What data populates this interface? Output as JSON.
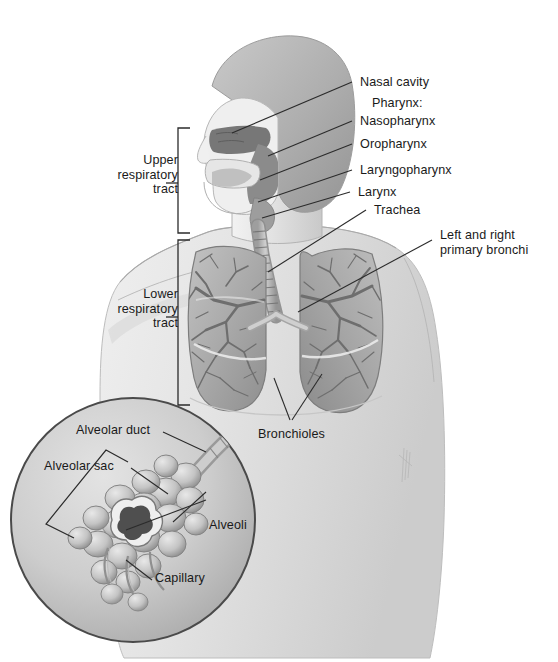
{
  "figure": {
    "background_color": "#ffffff",
    "ink_color": "#1a1a1a",
    "artist_signature": "illegible vertical artist signature"
  },
  "brackets": [
    {
      "name": "upper-respiratory-tract",
      "label": "Upper\nrespiratory\ntract"
    },
    {
      "name": "lower-respiratory-tract",
      "label": "Lower\nrespiratory\ntract"
    }
  ],
  "labels": {
    "nasal_cavity": "Nasal cavity",
    "pharynx": "Pharynx:",
    "nasopharynx": "Nasopharynx",
    "oropharynx": "Oropharynx",
    "laryngopharynx": "Laryngopharynx",
    "larynx": "Larynx",
    "trachea": "Trachea",
    "primary_bronchi": "Left and right\nprimary bronchi",
    "bronchioles": "Bronchioles",
    "alveolar_duct": "Alveolar duct",
    "alveolar_sac": "Alveolar sac",
    "alveoli": "Alveoli",
    "capillary": "Capillary"
  },
  "palette": {
    "skin_light": "#e9e9e9",
    "skin_mid": "#d4d4d4",
    "hair": "#b9b9b9",
    "cavity_dark": "#6f6f6f",
    "lung_mid": "#b2b2b2",
    "lung_dark": "#8a8a8a",
    "inset_fill": "#cfcfcf",
    "line": "#2b2b2b"
  }
}
